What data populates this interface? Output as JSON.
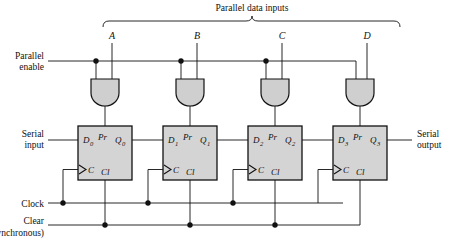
{
  "figure": {
    "title": "Parallel data inputs",
    "type": "4-bit shift register with parallel load logic diagram",
    "background": "#ffffff",
    "ink_color": "#111111",
    "block_fill": "#d4d4d4",
    "gate_fill": "#cfcfcf"
  },
  "bracket": {
    "label": "Parallel data inputs"
  },
  "data_inputs": [
    {
      "label": "A",
      "x": 112
    },
    {
      "label": "B",
      "x": 197
    },
    {
      "label": "C",
      "x": 282
    },
    {
      "label": "D",
      "x": 367
    }
  ],
  "left_labels": {
    "parallel_enable_line1": "Parallel",
    "parallel_enable_line2": "enable",
    "serial_input_line1": "Serial",
    "serial_input_line2": "input",
    "clock": "Clock",
    "clear_line1": "Clear",
    "clear_line2": "(asynchronous)"
  },
  "right_labels": {
    "serial_output_line1": "Serial",
    "serial_output_line2": "output"
  },
  "gates": [
    {
      "name": "and-gate-a",
      "type": "AND",
      "cx": 105
    },
    {
      "name": "and-gate-b",
      "type": "AND",
      "cx": 190
    },
    {
      "name": "and-gate-c",
      "type": "AND",
      "cx": 275
    },
    {
      "name": "and-gate-d",
      "type": "AND",
      "cx": 360
    }
  ],
  "flipflops": [
    {
      "name": "flipflop-0",
      "d": "D",
      "d_sub": "0",
      "pr": "Pr",
      "q": "Q",
      "q_sub": "0",
      "c": "C",
      "cl": "Cl",
      "x": 78
    },
    {
      "name": "flipflop-1",
      "d": "D",
      "d_sub": "1",
      "pr": "Pr",
      "q": "Q",
      "q_sub": "1",
      "c": "C",
      "cl": "Cl",
      "x": 163
    },
    {
      "name": "flipflop-2",
      "d": "D",
      "d_sub": "2",
      "pr": "Pr",
      "q": "Q",
      "q_sub": "2",
      "c": "C",
      "cl": "Cl",
      "x": 248
    },
    {
      "name": "flipflop-3",
      "d": "D",
      "d_sub": "3",
      "pr": "Pr",
      "q": "Q",
      "q_sub": "3",
      "c": "C",
      "cl": "Cl",
      "x": 333
    }
  ],
  "junction_dots": {
    "parallel_enable": [
      96,
      181,
      266
    ],
    "clock": [
      63,
      148,
      233
    ],
    "clear": [
      105,
      190,
      275
    ]
  }
}
